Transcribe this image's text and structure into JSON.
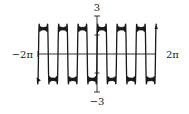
{
  "chart_data": {
    "type": "line",
    "title": "",
    "xlabel": "",
    "ylabel": "",
    "function": "f(x) = (8/π) Σ_{k=1}^{7} sin(3(2k−1)x)/(2k−1)  (Fourier partial sum of a square wave, amplitude 2, period 2π/3)",
    "terms": 7,
    "frequency": 3,
    "amplitude": 2,
    "xlim": [
      -6.2832,
      6.2832
    ],
    "ylim": [
      -3,
      3
    ],
    "x_tick_labels": [
      "−2π",
      "2π"
    ],
    "y_tick_labels": [
      "3",
      "−3"
    ],
    "y_ticks": [
      -3,
      -1.5,
      1.5,
      3
    ],
    "grid": false,
    "legend": null,
    "sample_points": {
      "x": [
        -6.2832,
        -5.7596,
        -5.236,
        -4.7124,
        -4.1888,
        -3.6652,
        -3.1416,
        -2.618,
        -2.0944,
        -1.5708,
        -1.0472,
        -0.5236,
        0,
        0.5236,
        1.0472,
        1.5708,
        2.0944,
        2.618,
        3.1416,
        3.6652,
        4.1888,
        4.7124,
        5.236,
        5.7596,
        6.2832
      ],
      "y": [
        0,
        2,
        0,
        -2,
        0,
        2,
        0,
        -2,
        0,
        2,
        0,
        -2,
        0,
        2,
        0,
        -2,
        0,
        2,
        0,
        -2,
        0,
        2,
        0,
        -2,
        0
      ]
    }
  },
  "axes": {
    "x_min_label": "−2π",
    "x_max_label": "2π",
    "y_max_label": "3",
    "y_min_label": "−3"
  },
  "colors": {
    "curve": "#1a1a1a",
    "axis": "#333333",
    "background": "#ffffff"
  }
}
